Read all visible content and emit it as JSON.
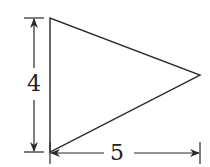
{
  "figure": {
    "shape": "triangle",
    "stroke_color": "#2a2a2a",
    "vertices": [
      [
        50,
        18
      ],
      [
        50,
        152
      ],
      [
        200,
        75
      ]
    ]
  },
  "dimensions": {
    "height": {
      "label": "4",
      "orientation": "vertical"
    },
    "width": {
      "label": "5",
      "orientation": "horizontal"
    }
  }
}
